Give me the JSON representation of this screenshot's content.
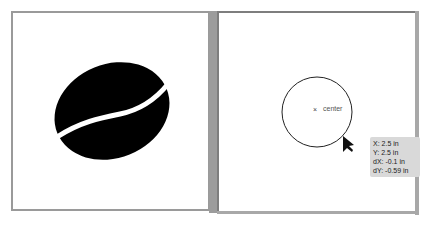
{
  "left_panel": {
    "artwork": "coffee-bean",
    "fill_color": "#000000"
  },
  "right_panel": {
    "shape": "circle",
    "stroke_color": "#222222",
    "center_label": "center",
    "center_marker": "×",
    "tooltip": {
      "x": "X: 2.5 in",
      "y": "Y: 2.5 in",
      "dx": "dX: -0.1 in",
      "dy": "dY: -0.59 in"
    }
  },
  "colors": {
    "frame": "#9a9a9a",
    "tooltip_bg": "#d9d9d9"
  }
}
